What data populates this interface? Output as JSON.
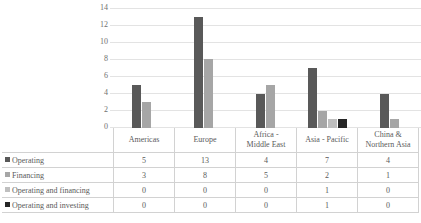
{
  "chart_data": {
    "type": "bar",
    "title": "",
    "subtitle": "",
    "xlabel": "",
    "ylabel": "",
    "ylim": [
      0,
      14
    ],
    "yticks": [
      14,
      12,
      10,
      8,
      6,
      4,
      2,
      0
    ],
    "grid": true,
    "legend_position": "data-table-left",
    "categories": [
      "Americas",
      "Africa - Middle East",
      "Europe",
      "Asia - Pacific",
      "China & Northern Asia"
    ],
    "category_display": [
      [
        "Americas"
      ],
      [
        "Europe"
      ],
      [
        "Africa -",
        "Middle East"
      ],
      [
        "Asia - Pacific"
      ],
      [
        "China &",
        "Northern Asia"
      ]
    ],
    "categories_ordered": [
      "Americas",
      "Europe",
      "Africa - Middle East",
      "Asia - Pacific",
      "China & Northern Asia"
    ],
    "series": [
      {
        "name": "Operating",
        "color": "#595959",
        "values": [
          5,
          13,
          4,
          7,
          4
        ]
      },
      {
        "name": "Financing",
        "color": "#a6a6a6",
        "values": [
          3,
          8,
          5,
          2,
          1
        ]
      },
      {
        "name": "Operating and financing",
        "color": "#bfbfbf",
        "values": [
          0,
          0,
          0,
          1,
          0
        ]
      },
      {
        "name": "Operating and investing",
        "color": "#262626",
        "values": [
          0,
          0,
          0,
          1,
          0
        ]
      }
    ]
  },
  "table": {
    "row_labels": [
      "Operating",
      "Financing",
      "Operating and financing",
      "Operating and investing"
    ],
    "rows": [
      [
        "5",
        "13",
        "4",
        "7",
        "4"
      ],
      [
        "3",
        "8",
        "5",
        "2",
        "1"
      ],
      [
        "0",
        "0",
        "0",
        "1",
        "0"
      ],
      [
        "0",
        "0",
        "0",
        "1",
        "0"
      ]
    ]
  },
  "axis": {
    "y_tick_0": "14",
    "y_tick_1": "12",
    "y_tick_2": "10",
    "y_tick_3": "8",
    "y_tick_4": "6",
    "y_tick_5": "4",
    "y_tick_6": "2",
    "y_tick_7": "0"
  }
}
